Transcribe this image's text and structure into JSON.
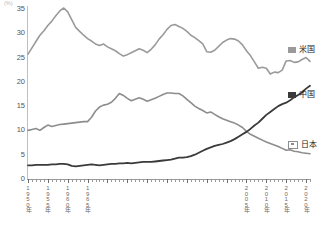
{
  "chart_data": {
    "type": "line",
    "title": "",
    "subtitle": "",
    "xlabel": "",
    "ylabel": "(%)",
    "y_unit": "(%)",
    "ylim": [
      0,
      35
    ],
    "yticks": [
      0,
      5,
      10,
      15,
      20,
      25,
      30,
      35
    ],
    "ytick_labels": [
      "0",
      "5",
      "10",
      "15",
      "20",
      "25",
      "30",
      "35"
    ],
    "xlim": [
      1950,
      2021
    ],
    "xticks": [
      1950,
      1955,
      1960,
      1965,
      1970,
      1975,
      1980,
      1985,
      1990,
      1995,
      2000,
      2005,
      2010,
      2015,
      2020
    ],
    "xtick_labels": [
      "1950年",
      "1955年",
      "1960年",
      "1965年",
      "1970年",
      "1975年",
      "1980年",
      "1985年",
      "1990年",
      "1995年",
      "2000年",
      "2005年",
      "2010年",
      "2015年",
      "2020年"
    ],
    "xtick_labels_shown": [
      "1950年",
      "1955年",
      "1960年",
      "1965年",
      "2005年",
      "2010年",
      "2015年",
      "2020年"
    ],
    "minor_tick_interval": 1,
    "grid": false,
    "legend_position": "right",
    "series": [
      {
        "name": "米国",
        "color": "#9a9a9a",
        "x": [
          1950,
          1951,
          1952,
          1953,
          1954,
          1955,
          1956,
          1957,
          1958,
          1959,
          1960,
          1961,
          1962,
          1963,
          1964,
          1965,
          1966,
          1967,
          1968,
          1969,
          1970,
          1971,
          1972,
          1973,
          1974,
          1975,
          1976,
          1977,
          1978,
          1979,
          1980,
          1981,
          1982,
          1983,
          1984,
          1985,
          1986,
          1987,
          1988,
          1989,
          1990,
          1991,
          1992,
          1993,
          1994,
          1995,
          1996,
          1997,
          1998,
          1999,
          2000,
          2001,
          2002,
          2003,
          2004,
          2005,
          2006,
          2007,
          2008,
          2009,
          2010,
          2011,
          2012,
          2013,
          2014,
          2015,
          2016,
          2017,
          2018,
          2019,
          2020,
          2021
        ],
        "values": [
          25.5,
          26.8,
          28.1,
          29.4,
          30.3,
          31.4,
          32.3,
          33.4,
          34.4,
          35.0,
          34.2,
          32.6,
          31.0,
          30.2,
          29.4,
          28.7,
          28.2,
          27.6,
          27.3,
          27.6,
          27.0,
          26.6,
          26.2,
          25.6,
          25.1,
          25.4,
          25.8,
          26.2,
          26.6,
          26.3,
          25.8,
          26.5,
          27.4,
          28.6,
          29.5,
          30.6,
          31.4,
          31.6,
          31.2,
          30.8,
          30.2,
          29.4,
          28.9,
          28.3,
          27.6,
          26.0,
          25.9,
          26.3,
          27.1,
          27.9,
          28.4,
          28.7,
          28.6,
          28.2,
          27.4,
          26.2,
          25.2,
          23.9,
          22.6,
          22.8,
          22.6,
          21.4,
          21.8,
          21.7,
          22.2,
          24.1,
          24.2,
          23.8,
          23.9,
          24.4,
          24.8,
          24.0
        ],
        "first_value": 25.5,
        "peak_value": 35.0,
        "peak_year": 1959,
        "last_value": 24.0
      },
      {
        "name": "中国",
        "color": "#3a3a3a",
        "x": [
          1950,
          1951,
          1952,
          1953,
          1954,
          1955,
          1956,
          1957,
          1958,
          1959,
          1960,
          1961,
          1962,
          1963,
          1964,
          1965,
          1966,
          1967,
          1968,
          1969,
          1970,
          1971,
          1972,
          1973,
          1974,
          1975,
          1976,
          1977,
          1978,
          1979,
          1980,
          1981,
          1982,
          1983,
          1984,
          1985,
          1986,
          1987,
          1988,
          1989,
          1990,
          1991,
          1992,
          1993,
          1994,
          1995,
          1996,
          1997,
          1998,
          1999,
          2000,
          2001,
          2002,
          2003,
          2004,
          2005,
          2006,
          2007,
          2008,
          2009,
          2010,
          2011,
          2012,
          2013,
          2014,
          2015,
          2016,
          2017,
          2018,
          2019,
          2020,
          2021
        ],
        "values": [
          2.6,
          2.6,
          2.7,
          2.7,
          2.7,
          2.7,
          2.8,
          2.8,
          2.9,
          2.9,
          2.8,
          2.5,
          2.4,
          2.5,
          2.6,
          2.7,
          2.8,
          2.7,
          2.6,
          2.7,
          2.8,
          2.9,
          2.9,
          3.0,
          3.0,
          3.1,
          3.0,
          3.1,
          3.2,
          3.3,
          3.3,
          3.3,
          3.4,
          3.5,
          3.6,
          3.7,
          3.8,
          4.0,
          4.2,
          4.2,
          4.3,
          4.5,
          4.8,
          5.2,
          5.6,
          6.0,
          6.3,
          6.6,
          6.8,
          7.0,
          7.3,
          7.6,
          8.0,
          8.5,
          9.0,
          9.5,
          10.1,
          10.8,
          11.4,
          12.2,
          13.0,
          13.6,
          14.2,
          14.8,
          15.2,
          15.5,
          16.0,
          16.6,
          17.1,
          17.6,
          18.4,
          19.0
        ],
        "first_value": 2.6,
        "last_value": 19.0
      },
      {
        "name": "日本",
        "color": "#8d8d8d",
        "x": [
          1950,
          1951,
          1952,
          1953,
          1954,
          1955,
          1956,
          1957,
          1958,
          1959,
          1960,
          1961,
          1962,
          1963,
          1964,
          1965,
          1966,
          1967,
          1968,
          1969,
          1970,
          1971,
          1972,
          1973,
          1974,
          1975,
          1976,
          1977,
          1978,
          1979,
          1980,
          1981,
          1982,
          1983,
          1984,
          1985,
          1986,
          1987,
          1988,
          1989,
          1990,
          1991,
          1992,
          1993,
          1994,
          1995,
          1996,
          1997,
          1998,
          1999,
          2000,
          2001,
          2002,
          2003,
          2004,
          2005,
          2006,
          2007,
          2008,
          2009,
          2010,
          2011,
          2012,
          2013,
          2014,
          2015,
          2016,
          2017,
          2018,
          2019,
          2020,
          2021
        ],
        "values": [
          9.8,
          10.0,
          10.2,
          9.8,
          10.4,
          10.9,
          10.6,
          10.8,
          11.0,
          11.1,
          11.2,
          11.3,
          11.4,
          11.5,
          11.6,
          11.6,
          12.5,
          13.8,
          14.6,
          15.0,
          15.2,
          15.6,
          16.4,
          17.4,
          17.0,
          16.4,
          15.9,
          16.2,
          16.5,
          16.2,
          15.8,
          16.1,
          16.4,
          16.8,
          17.2,
          17.5,
          17.5,
          17.4,
          17.4,
          16.9,
          16.2,
          15.5,
          14.8,
          14.3,
          13.9,
          13.4,
          13.6,
          13.1,
          12.6,
          12.2,
          11.9,
          11.6,
          11.3,
          10.9,
          10.4,
          9.6,
          9.0,
          8.6,
          8.2,
          7.8,
          7.4,
          7.1,
          6.8,
          6.5,
          6.1,
          5.7,
          5.8,
          5.5,
          5.4,
          5.2,
          5.1,
          5.0
        ],
        "first_value": 9.8,
        "peak_value": 17.5,
        "last_value": 5.0
      }
    ]
  },
  "legend": {
    "items": [
      {
        "label": "米国",
        "swatch_class": "sw-us",
        "top_px": 46
      },
      {
        "label": "中国",
        "swatch_class": "sw-cn",
        "top_px": 91
      },
      {
        "label": "日本",
        "swatch_class": "sw-jp",
        "top_px": 141
      }
    ]
  }
}
